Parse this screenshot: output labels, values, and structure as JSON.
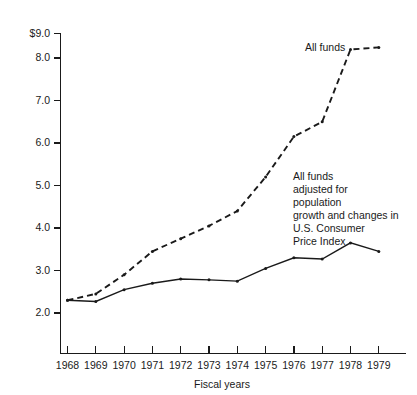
{
  "chart_data": {
    "type": "line",
    "title": "",
    "xlabel": "Fiscal years",
    "ylabel": "",
    "grid": false,
    "legend_position": "inline-annotations",
    "x": [
      1968,
      1969,
      1970,
      1971,
      1972,
      1973,
      1974,
      1975,
      1976,
      1977,
      1978,
      1979
    ],
    "categories": [
      "1968",
      "1969",
      "1970",
      "1971",
      "1972",
      "1973",
      "1974",
      "1975",
      "1976",
      "1977",
      "1978",
      "1979"
    ],
    "xlim": [
      1967.5,
      1979.5
    ],
    "ylim": [
      1.55,
      9.0
    ],
    "ytick_labels": [
      "$9.0",
      "8.0",
      "7.0",
      "6.0",
      "5.0",
      "4.0",
      "3.0",
      "2.0"
    ],
    "ytick_values": [
      9.0,
      8.0,
      7.0,
      6.0,
      5.0,
      4.0,
      3.0,
      2.0
    ],
    "series": [
      {
        "name": "All funds",
        "style": "dashed",
        "values": [
          2.3,
          2.45,
          2.9,
          3.45,
          3.75,
          4.05,
          4.4,
          5.2,
          6.15,
          6.5,
          8.2,
          8.25
        ]
      },
      {
        "name": "All funds adjusted for population growth and changes in U.S. Consumer Price Index",
        "style": "solid",
        "values": [
          2.3,
          2.27,
          2.55,
          2.7,
          2.8,
          2.78,
          2.75,
          3.05,
          3.3,
          3.27,
          3.65,
          3.45
        ]
      }
    ],
    "annotations": [
      {
        "id": "all-funds",
        "lines": [
          "All funds"
        ]
      },
      {
        "id": "adjusted",
        "lines": [
          "All funds",
          "adjusted for",
          "population",
          "growth and changes in",
          "U.S. Consumer",
          "Price Index"
        ]
      }
    ]
  },
  "labels": {
    "y_0": "$9.0",
    "y_1": "8.0",
    "y_2": "7.0",
    "y_3": "6.0",
    "y_4": "5.0",
    "y_5": "4.0",
    "y_6": "3.0",
    "y_7": "2.0",
    "x_0": "1968",
    "x_1": "1969",
    "x_2": "1970",
    "x_3": "1971",
    "x_4": "1972",
    "x_5": "1973",
    "x_6": "1974",
    "x_7": "1975",
    "x_8": "1976",
    "x_9": "1977",
    "x_10": "1978",
    "x_11": "1979",
    "x_axis_title": "Fiscal years",
    "ann_all_funds": "All funds",
    "ann_adj_1": "All funds",
    "ann_adj_2": "adjusted for",
    "ann_adj_3": "population",
    "ann_adj_4": "growth and changes in",
    "ann_adj_5": "U.S. Consumer",
    "ann_adj_6": "Price Index"
  },
  "colors": {
    "ink": "#1a1a1a",
    "background": "#ffffff"
  }
}
